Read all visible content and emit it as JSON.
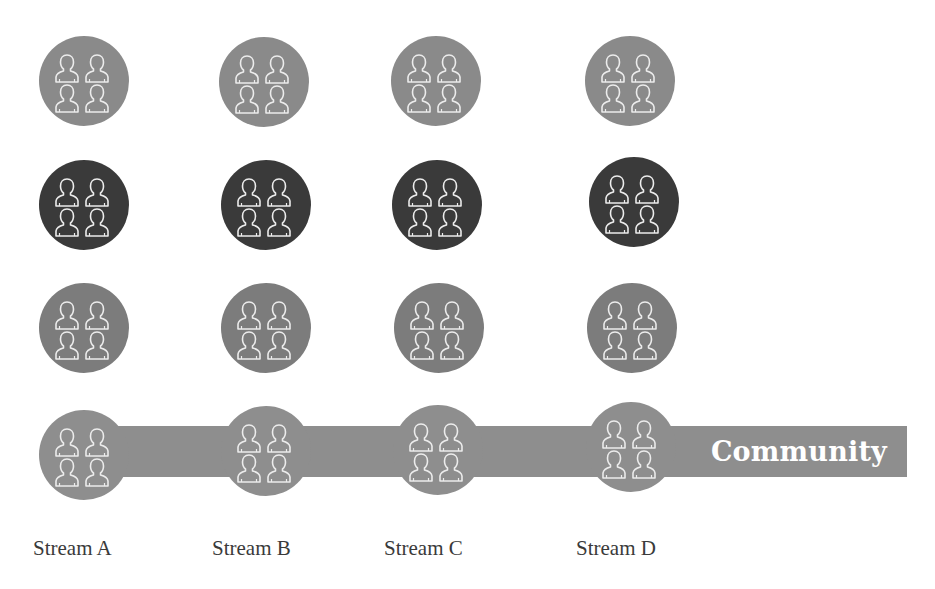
{
  "diagram": {
    "colors": {
      "tier1": "#8a8a8a",
      "tier2": "#3a3a3a",
      "tier3": "#7c7c7c",
      "community": "#8e8e8e",
      "icon_stroke": "#ececec"
    },
    "community_bar": {
      "label": "Community"
    },
    "icon": "group-of-four-users-icon",
    "streams": [
      {
        "label": "Stream A"
      },
      {
        "label": "Stream B"
      },
      {
        "label": "Stream C"
      },
      {
        "label": "Stream D"
      }
    ],
    "rows": [
      {
        "tier": "tier1"
      },
      {
        "tier": "tier2"
      },
      {
        "tier": "tier3"
      },
      {
        "tier": "community"
      }
    ]
  }
}
